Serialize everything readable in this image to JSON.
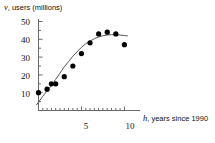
{
  "chart_data": {
    "type": "scatter",
    "title": "",
    "subtitle": "",
    "xlabel": "h, years since 1990",
    "xlabel_var": "h",
    "xlabel_rest": ", years since 1990",
    "ylabel": "v, users (millions)",
    "ylabel_var": "v",
    "ylabel_rest": ", users (millions)",
    "xlim": [
      0,
      11.6
    ],
    "ylim": [
      0,
      54
    ],
    "grid": false,
    "legend": false,
    "legend_position": "none",
    "xticks": [
      0,
      1,
      2,
      3,
      4,
      5,
      6,
      7,
      8,
      9,
      10
    ],
    "xtick_labels": [
      "",
      "",
      "",
      "",
      "",
      "5",
      "",
      "",
      "",
      "",
      "10"
    ],
    "yticks": [
      5,
      10,
      15,
      20,
      25,
      30,
      35,
      40,
      45,
      50
    ],
    "ytick_labels": [
      "",
      "10",
      "",
      "20",
      "",
      "30",
      "",
      "40",
      "",
      "50"
    ],
    "x": [
      0,
      1,
      1.5,
      2,
      3,
      4,
      5,
      6,
      7,
      8,
      9,
      10
    ],
    "values": [
      10,
      12,
      15,
      15,
      19,
      25,
      32,
      38,
      43,
      44,
      43,
      37
    ],
    "points": [
      {
        "h": 0,
        "v": 10
      },
      {
        "h": 1,
        "v": 12
      },
      {
        "h": 1.5,
        "v": 15
      },
      {
        "h": 2,
        "v": 15
      },
      {
        "h": 3,
        "v": 19
      },
      {
        "h": 4,
        "v": 25
      },
      {
        "h": 5,
        "v": 32
      },
      {
        "h": 6,
        "v": 38
      },
      {
        "h": 7,
        "v": 43
      },
      {
        "h": 8,
        "v": 44
      },
      {
        "h": 9,
        "v": 43
      },
      {
        "h": 10,
        "v": 37
      }
    ],
    "series": [
      {
        "name": "data points",
        "type": "scatter",
        "marker": "filled-circle",
        "color": "#000000",
        "values": [
          10,
          12,
          15,
          15,
          19,
          25,
          32,
          38,
          43,
          44,
          43,
          37
        ]
      },
      {
        "name": "fitted curve",
        "type": "line",
        "color": "#555555",
        "x": [
          -0.25,
          0.5,
          1,
          1.5,
          2,
          2.5,
          3,
          3.5,
          4,
          4.5,
          5,
          5.5,
          6,
          6.5,
          7,
          7.5,
          8,
          8.5,
          9,
          9.5,
          10,
          10.4
        ],
        "values": [
          3,
          8,
          11,
          14,
          17.5,
          21,
          24.5,
          27.5,
          30.5,
          33,
          35.5,
          37.5,
          39,
          40.3,
          41.3,
          42,
          42.4,
          42.6,
          42.6,
          42.4,
          42.1,
          41.9
        ]
      }
    ],
    "marker_color": "#000000",
    "curve_color": "#555555",
    "axis_color": "#6b6b6b",
    "text_color": "#111111",
    "background": "#ffffff"
  }
}
